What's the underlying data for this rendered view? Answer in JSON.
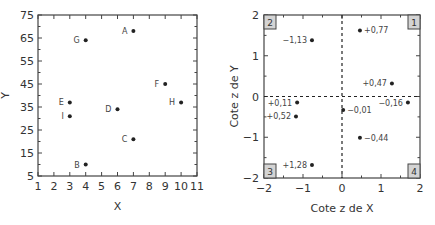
{
  "chart_data": [
    {
      "type": "scatter",
      "title": "",
      "xlabel": "X",
      "ylabel": "Y",
      "xlim": [
        1,
        11
      ],
      "ylim": [
        5,
        75
      ],
      "xticks": [
        1,
        2,
        3,
        4,
        5,
        6,
        7,
        8,
        9,
        10,
        11
      ],
      "yticks": [
        5,
        15,
        25,
        35,
        45,
        55,
        65,
        75
      ],
      "grid": false,
      "points": [
        {
          "label": "A",
          "x": 7,
          "y": 68
        },
        {
          "label": "G",
          "x": 4,
          "y": 64
        },
        {
          "label": "F",
          "x": 9,
          "y": 45
        },
        {
          "label": "H",
          "x": 10,
          "y": 37
        },
        {
          "label": "E",
          "x": 3,
          "y": 37
        },
        {
          "label": "D",
          "x": 6,
          "y": 34
        },
        {
          "label": "I",
          "x": 3,
          "y": 31
        },
        {
          "label": "C",
          "x": 7,
          "y": 21
        },
        {
          "label": "B",
          "x": 4,
          "y": 10
        }
      ]
    },
    {
      "type": "scatter",
      "title": "",
      "xlabel": "Cote z de X",
      "ylabel": "Cote z de Y",
      "xlim": [
        -2,
        2
      ],
      "ylim": [
        -2,
        2
      ],
      "xticks": [
        "−2",
        "−1",
        "0",
        "1",
        "2"
      ],
      "yticks": [
        "−2",
        "−1",
        "0",
        "1",
        "2"
      ],
      "grid": false,
      "reference_lines": {
        "x": 0,
        "y": 0,
        "style": "dashed"
      },
      "quadrant_labels": [
        "1",
        "2",
        "3",
        "4"
      ],
      "points": [
        {
          "label": "−1,13",
          "x": -0.77,
          "y": 1.38,
          "label_side": "left"
        },
        {
          "label": "+0,77",
          "x": 0.46,
          "y": 1.62,
          "label_side": "right"
        },
        {
          "label": "+0,47",
          "x": 1.28,
          "y": 0.32,
          "label_side": "left"
        },
        {
          "label": "−0,16",
          "x": 1.69,
          "y": -0.15,
          "label_side": "left"
        },
        {
          "label": "+0,11",
          "x": -1.15,
          "y": -0.15,
          "label_side": "left"
        },
        {
          "label": "−0,01",
          "x": 0.03,
          "y": -0.33,
          "label_side": "right"
        },
        {
          "label": "+0,52",
          "x": -1.18,
          "y": -0.49,
          "label_side": "left"
        },
        {
          "label": "−0,44",
          "x": 0.46,
          "y": -1.01,
          "label_side": "right"
        },
        {
          "label": "+1,28",
          "x": -0.77,
          "y": -1.68,
          "label_side": "left"
        }
      ]
    }
  ]
}
